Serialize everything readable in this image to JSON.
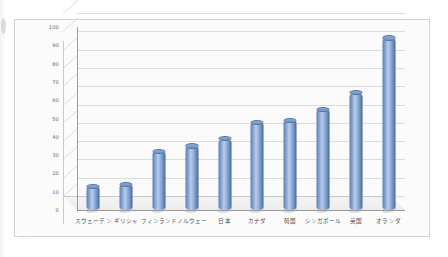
{
  "chart_data": {
    "type": "bar",
    "title": "",
    "subtitle": "",
    "xlabel": "",
    "ylabel": "",
    "categories": [
      "スウェーデン",
      "ギリシャ",
      "フィンランド",
      "ノルウェー",
      "日本",
      "カナダ",
      "韓国",
      "シンガポール",
      "英国",
      "オランダ"
    ],
    "values": [
      13,
      14,
      32,
      35,
      39,
      48,
      49,
      55,
      64,
      94
    ],
    "series": [
      {
        "name": "",
        "values": [
          13,
          14,
          32,
          35,
          39,
          48,
          49,
          55,
          64,
          94
        ]
      }
    ],
    "ylim": [
      0,
      100
    ],
    "ytick_labels": [
      "0",
      "10",
      "20",
      "30",
      "40",
      "50",
      "60",
      "70",
      "80",
      "90",
      "100"
    ],
    "ytick_values": [
      0,
      10,
      20,
      30,
      40,
      50,
      60,
      70,
      80,
      90,
      100
    ],
    "grid": true,
    "legend": false,
    "legend_position": "none",
    "style": "3d-cylinder",
    "bar_color": "#7d9fd1",
    "bar_color_dark": "#42618e",
    "bar_color_light": "#b9cde8",
    "grid_color": "#dcdcdc",
    "axis_color": "#9a9a9a",
    "plot_background": "#fbfbfb",
    "frame_border_color": "#d2d2d2"
  }
}
